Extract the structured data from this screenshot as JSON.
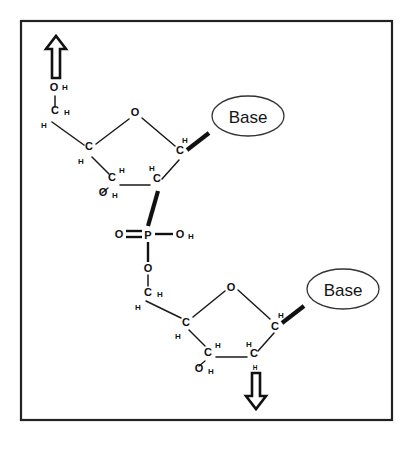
{
  "figure": {
    "frame": {
      "color": "#222222"
    },
    "labels": {
      "base_upper": "Base",
      "base_lower": "Base",
      "phosphorus": "P",
      "oxygen": "O",
      "carbon": "C",
      "hydrogen": "H"
    },
    "direction_arrows": [
      {
        "name": "arrow-up-5-prime",
        "direction": "up"
      },
      {
        "name": "arrow-down-3-prime",
        "direction": "down"
      }
    ],
    "atoms_upper_nucleotide": [
      {
        "id": "o5h-o",
        "text": "O",
        "x": 54,
        "y": 91,
        "size": "main"
      },
      {
        "id": "o5h-h",
        "text": "H",
        "x": 65,
        "y": 90,
        "size": "sub"
      },
      {
        "id": "c5",
        "text": "C",
        "x": 55,
        "y": 114,
        "size": "main"
      },
      {
        "id": "c5-h-right",
        "text": "H",
        "x": 67,
        "y": 115,
        "size": "sub"
      },
      {
        "id": "c5-h-left",
        "text": "H",
        "x": 44,
        "y": 128,
        "size": "sub"
      },
      {
        "id": "ring-o",
        "text": "O",
        "x": 135,
        "y": 116,
        "size": "main"
      },
      {
        "id": "c4",
        "text": "C",
        "x": 89,
        "y": 150,
        "size": "main"
      },
      {
        "id": "c4-h",
        "text": "H",
        "x": 81,
        "y": 164,
        "size": "sub"
      },
      {
        "id": "c1",
        "text": "C",
        "x": 180,
        "y": 154,
        "size": "main"
      },
      {
        "id": "c1-h",
        "text": "H",
        "x": 185,
        "y": 143,
        "size": "sub"
      },
      {
        "id": "c3",
        "text": "C",
        "x": 112,
        "y": 181,
        "size": "main"
      },
      {
        "id": "c3-h",
        "text": "H",
        "x": 122,
        "y": 173,
        "size": "sub"
      },
      {
        "id": "c3-o",
        "text": "O",
        "x": 103,
        "y": 196,
        "size": "main"
      },
      {
        "id": "c3-oh-h",
        "text": "H",
        "x": 115,
        "y": 198,
        "size": "sub"
      },
      {
        "id": "c2",
        "text": "C",
        "x": 157,
        "y": 182,
        "size": "main"
      },
      {
        "id": "c2-h",
        "text": "H",
        "x": 152,
        "y": 171,
        "size": "sub"
      }
    ],
    "atoms_phosphate": [
      {
        "id": "p",
        "text": "P",
        "x": 148,
        "y": 235,
        "size": "main"
      },
      {
        "id": "p-double-o",
        "text": "O",
        "x": 119,
        "y": 232,
        "size": "main"
      },
      {
        "id": "p-oh-o",
        "text": "O",
        "x": 180,
        "y": 234,
        "size": "main"
      },
      {
        "id": "p-oh-h",
        "text": "H",
        "x": 191,
        "y": 235,
        "size": "sub"
      },
      {
        "id": "p-ester-o",
        "text": "O",
        "x": 148,
        "y": 269,
        "size": "main"
      }
    ],
    "atoms_lower_nucleotide": [
      {
        "id": "c5b",
        "text": "C",
        "x": 148,
        "y": 293,
        "size": "main"
      },
      {
        "id": "c5b-h-right",
        "text": "H",
        "x": 160,
        "y": 294,
        "size": "sub"
      },
      {
        "id": "c5b-h-left",
        "text": "H",
        "x": 138,
        "y": 307,
        "size": "sub"
      },
      {
        "id": "ring-o-b",
        "text": "O",
        "x": 231,
        "y": 288,
        "size": "main"
      },
      {
        "id": "c4b",
        "text": "C",
        "x": 186,
        "y": 323,
        "size": "main"
      },
      {
        "id": "c4b-h",
        "text": "H",
        "x": 178,
        "y": 336,
        "size": "sub"
      },
      {
        "id": "c1b",
        "text": "C",
        "x": 275,
        "y": 327,
        "size": "main"
      },
      {
        "id": "c1b-h",
        "text": "H",
        "x": 281,
        "y": 315,
        "size": "sub"
      },
      {
        "id": "c3b",
        "text": "C",
        "x": 208,
        "y": 353,
        "size": "main"
      },
      {
        "id": "c3b-h",
        "text": "H",
        "x": 218,
        "y": 345,
        "size": "sub"
      },
      {
        "id": "c3b-o",
        "text": "O",
        "x": 199,
        "y": 369,
        "size": "main"
      },
      {
        "id": "c3b-oh-h",
        "text": "H",
        "x": 211,
        "y": 371,
        "size": "sub"
      },
      {
        "id": "c2b",
        "text": "C",
        "x": 254,
        "y": 354,
        "size": "main"
      },
      {
        "id": "c2b-h",
        "text": "H",
        "x": 249,
        "y": 344,
        "size": "sub"
      },
      {
        "id": "c2b-h-down",
        "text": "H",
        "x": 255,
        "y": 368,
        "size": "tiny"
      }
    ]
  }
}
